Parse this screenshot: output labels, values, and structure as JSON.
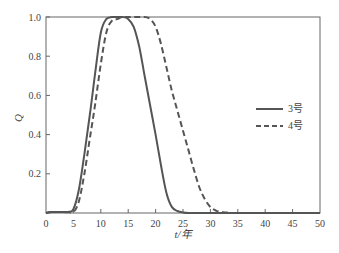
{
  "chart_data": {
    "type": "line",
    "title": "",
    "xlabel": "t/年",
    "ylabel": "Q",
    "xlim": [
      0,
      50
    ],
    "ylim": [
      0,
      1.0
    ],
    "xticks": [
      0,
      5,
      10,
      15,
      20,
      25,
      30,
      35,
      40,
      45,
      50
    ],
    "yticks": [
      0.2,
      0.4,
      0.6,
      0.8,
      1.0
    ],
    "ytick_labels": [
      "0.2",
      "0.4",
      "0.6",
      "0.8",
      "1.0"
    ],
    "grid": false,
    "legend_position": "right-middle",
    "x": [
      0,
      1,
      2,
      3,
      4,
      5,
      6,
      7,
      8,
      9,
      10,
      11,
      12,
      13,
      14,
      15,
      16,
      17,
      18,
      19,
      20,
      21,
      22,
      23,
      24,
      25,
      26,
      27,
      28,
      29,
      30,
      31,
      32,
      33,
      34,
      35,
      36,
      40,
      45,
      50
    ],
    "series": [
      {
        "name": "3号",
        "style": "solid",
        "color": "#555555",
        "values": [
          0,
          0.005,
          0.005,
          0.005,
          0.005,
          0.02,
          0.12,
          0.3,
          0.5,
          0.72,
          0.92,
          0.99,
          1.0,
          1.0,
          1.0,
          0.99,
          0.95,
          0.85,
          0.7,
          0.55,
          0.4,
          0.24,
          0.1,
          0.03,
          0.01,
          0.003,
          0,
          0,
          0,
          0,
          0,
          0,
          0,
          0,
          0,
          0,
          0,
          0,
          0,
          0
        ]
      },
      {
        "name": "4号",
        "style": "dashed",
        "color": "#555555",
        "values": [
          0,
          0.005,
          0.005,
          0.005,
          0.005,
          0.005,
          0.06,
          0.2,
          0.38,
          0.56,
          0.76,
          0.92,
          0.98,
          0.99,
          1.0,
          1.0,
          1.0,
          1.0,
          1.0,
          0.99,
          0.95,
          0.86,
          0.74,
          0.62,
          0.52,
          0.42,
          0.32,
          0.22,
          0.13,
          0.07,
          0.03,
          0.012,
          0.005,
          0.002,
          0,
          0,
          0,
          0,
          0,
          0
        ]
      }
    ]
  },
  "legend": {
    "items": [
      {
        "label": "3号",
        "style": "solid"
      },
      {
        "label": "4号",
        "style": "dashed"
      }
    ]
  },
  "axes": {
    "xlabel": "t/年",
    "ylabel": "Q",
    "xtick_labels": [
      "0",
      "5",
      "10",
      "15",
      "20",
      "25",
      "30",
      "35",
      "40",
      "45",
      "50"
    ],
    "ytick_labels": [
      "0.2",
      "0.4",
      "0.6",
      "0.8",
      "1.0"
    ]
  }
}
